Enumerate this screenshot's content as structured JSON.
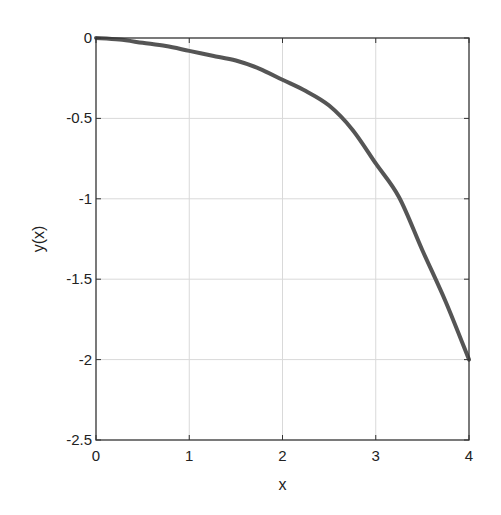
{
  "chart_data": {
    "type": "line",
    "title": "",
    "xlabel": "x",
    "ylabel": "y(x)",
    "xlim": [
      0,
      4
    ],
    "ylim": [
      -2.5,
      0
    ],
    "grid": true,
    "legend": null,
    "x_ticks": [
      0,
      1,
      2,
      3,
      4
    ],
    "x_tick_labels": [
      "0",
      "1",
      "2",
      "3",
      "4"
    ],
    "y_ticks": [
      0,
      -0.5,
      -1,
      -1.5,
      -2,
      -2.5
    ],
    "y_tick_labels": [
      "0",
      "-0.5",
      "-1",
      "-1.5",
      "-2",
      "-2.5"
    ],
    "series": [
      {
        "name": "y(x)",
        "color": "#555555",
        "x": [
          0,
          0.25,
          0.5,
          0.75,
          1.0,
          1.25,
          1.5,
          1.75,
          2.0,
          2.25,
          2.5,
          2.75,
          3.0,
          3.25,
          3.5,
          3.75,
          4.0
        ],
        "values": [
          0,
          -0.01,
          -0.03,
          -0.05,
          -0.08,
          -0.11,
          -0.14,
          -0.19,
          -0.26,
          -0.33,
          -0.42,
          -0.57,
          -0.78,
          -0.99,
          -1.32,
          -1.64,
          -2.0
        ]
      }
    ]
  },
  "colors": {
    "axis": "#333333",
    "grid": "#d9d9d9",
    "line": "#555555"
  }
}
